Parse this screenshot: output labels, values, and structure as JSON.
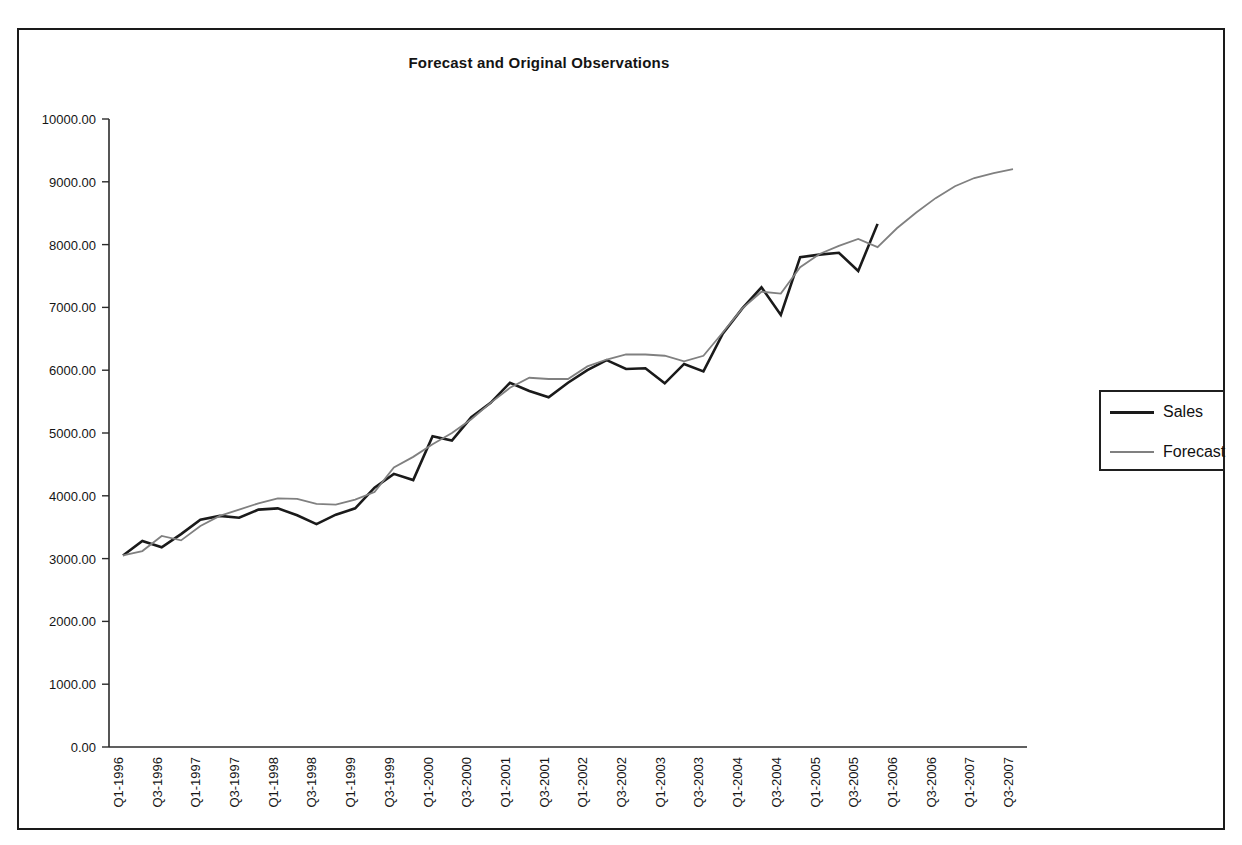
{
  "chart_data": {
    "type": "line",
    "title": "Forecast and Original Observations",
    "xlabel": "",
    "ylabel": "",
    "ylim": [
      0,
      10000
    ],
    "ytick_labels": [
      "0.00",
      "1000.00",
      "2000.00",
      "3000.00",
      "4000.00",
      "5000.00",
      "6000.00",
      "7000.00",
      "8000.00",
      "9000.00",
      "10000.00"
    ],
    "ytick_values": [
      0,
      1000,
      2000,
      3000,
      4000,
      5000,
      6000,
      7000,
      8000,
      9000,
      10000
    ],
    "grid": false,
    "legend_position": "right",
    "x_tick_labels": [
      "Q1-1996",
      "Q3-1996",
      "Q1-1997",
      "Q3-1997",
      "Q1-1998",
      "Q3-1998",
      "Q1-1999",
      "Q3-1999",
      "Q1-2000",
      "Q3-2000",
      "Q1-2001",
      "Q3-2001",
      "Q1-2002",
      "Q3-2002",
      "Q1-2003",
      "Q3-2003",
      "Q1-2004",
      "Q3-2004",
      "Q1-2005",
      "Q3-2005",
      "Q1-2006",
      "Q3-2006",
      "Q1-2007",
      "Q3-2007"
    ],
    "x_quarters": [
      "Q1-1996",
      "Q2-1996",
      "Q3-1996",
      "Q4-1996",
      "Q1-1997",
      "Q2-1997",
      "Q3-1997",
      "Q4-1997",
      "Q1-1998",
      "Q2-1998",
      "Q3-1998",
      "Q4-1998",
      "Q1-1999",
      "Q2-1999",
      "Q3-1999",
      "Q4-1999",
      "Q1-2000",
      "Q2-2000",
      "Q3-2000",
      "Q4-2000",
      "Q1-2001",
      "Q2-2001",
      "Q3-2001",
      "Q4-2001",
      "Q1-2002",
      "Q2-2002",
      "Q3-2002",
      "Q4-2002",
      "Q1-2003",
      "Q2-2003",
      "Q3-2003",
      "Q4-2003",
      "Q1-2004",
      "Q2-2004",
      "Q3-2004",
      "Q4-2004",
      "Q1-2005",
      "Q2-2005",
      "Q3-2005",
      "Q4-2005",
      "Q1-2006",
      "Q2-2006",
      "Q3-2006",
      "Q4-2006",
      "Q1-2007",
      "Q2-2007",
      "Q3-2007"
    ],
    "series": [
      {
        "name": "Sales",
        "color": "#1a1a1a",
        "values": [
          3050,
          3280,
          3180,
          3390,
          3620,
          3680,
          3650,
          3780,
          3800,
          3690,
          3550,
          3700,
          3800,
          4130,
          4350,
          4250,
          4950,
          4880,
          5250,
          5480,
          5800,
          5670,
          5570,
          5800,
          6000,
          6160,
          6020,
          6030,
          5790,
          6100,
          5980,
          6580,
          6980,
          7320,
          6880,
          7800,
          7840,
          7870,
          7580,
          8330
        ]
      },
      {
        "name": "Forecast",
        "color": "#808080",
        "values": [
          3050,
          3120,
          3360,
          3290,
          3520,
          3680,
          3780,
          3880,
          3960,
          3950,
          3870,
          3860,
          3940,
          4060,
          4450,
          4620,
          4820,
          5000,
          5220,
          5480,
          5720,
          5880,
          5860,
          5860,
          6060,
          6170,
          6250,
          6250,
          6230,
          6140,
          6230,
          6600,
          6980,
          7250,
          7220,
          7640,
          7850,
          7980,
          8090,
          7960,
          8260,
          8510,
          8740,
          8930,
          9060,
          9140,
          9200
        ]
      }
    ]
  },
  "legend": {
    "entries": [
      {
        "label": "Sales",
        "color": "#1a1a1a"
      },
      {
        "label": "Forecast",
        "color": "#808080"
      }
    ]
  }
}
